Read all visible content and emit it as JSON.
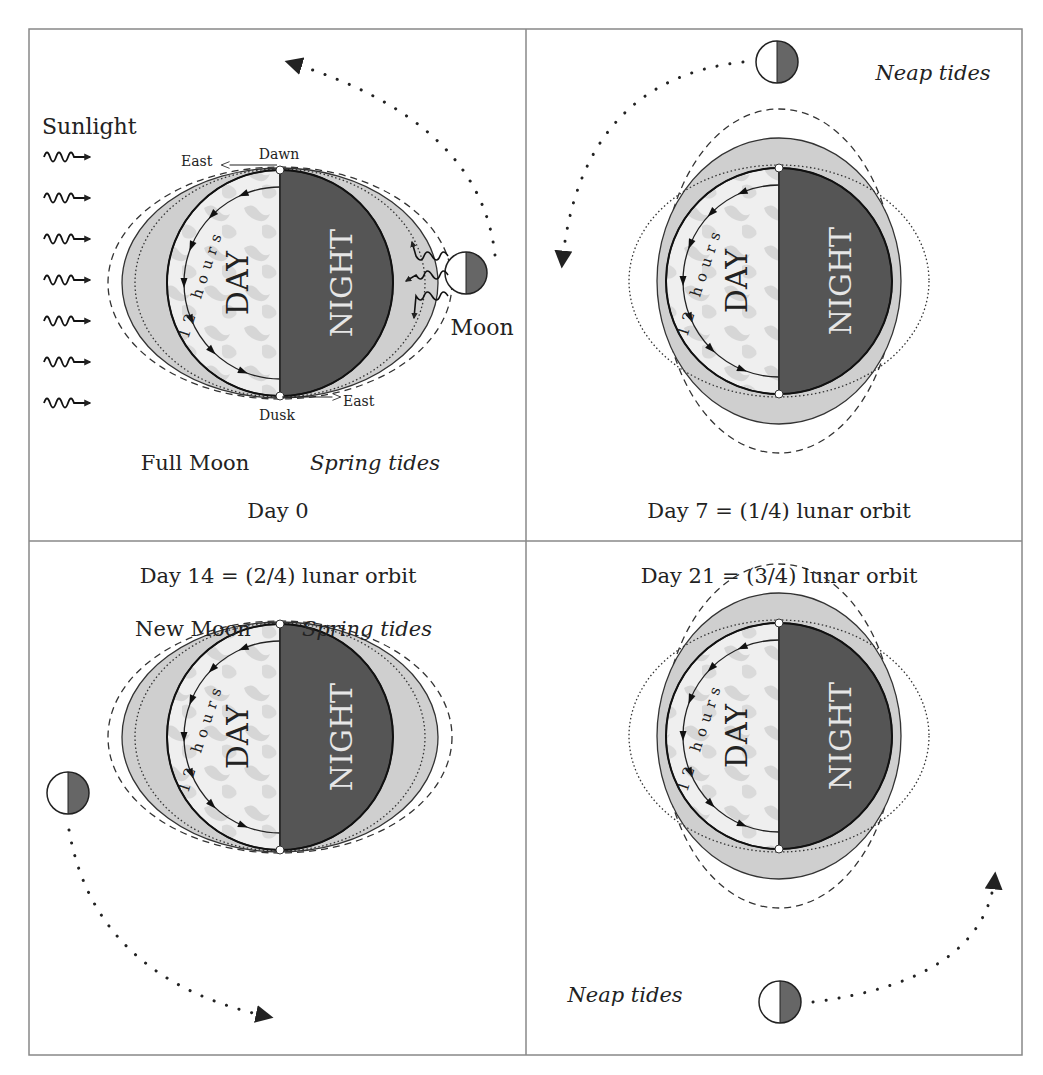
{
  "figure": {
    "colors": {
      "ocean_bulge": "#cfcfcf",
      "earth_day": "#e6e6e6",
      "earth_night": "#555555",
      "moon_dark": "#666666",
      "frame": "#888888",
      "ink": "#222222"
    },
    "common": {
      "day_label": "DAY",
      "night_label": "NIGHT",
      "hours_label": "12 hours"
    },
    "panels": [
      {
        "id": "day0",
        "caption": "Day 0",
        "phase_label": "Full Moon",
        "tide_label": "Spring tides",
        "sunlight_label": "Sunlight",
        "moon_label": "Moon",
        "dawn_label": "Dawn",
        "dusk_label": "Dusk",
        "east_label": "East",
        "bulge_orientation": "horizontal",
        "moon_position": "right",
        "orbit_arrow_direction": "counterclockwise"
      },
      {
        "id": "day7",
        "caption": "Day 7 = (1/4) lunar orbit",
        "tide_label": "Neap tides",
        "bulge_orientation": "vertical",
        "moon_position": "top",
        "orbit_arrow_direction": "counterclockwise"
      },
      {
        "id": "day14",
        "caption": "Day 14 = (2/4) lunar orbit",
        "phase_label": "New Moon",
        "tide_label": "Spring tides",
        "bulge_orientation": "horizontal",
        "moon_position": "left",
        "orbit_arrow_direction": "counterclockwise"
      },
      {
        "id": "day21",
        "caption": "Day 21 = (3/4) lunar orbit",
        "tide_label": "Neap tides",
        "bulge_orientation": "vertical",
        "moon_position": "bottom",
        "orbit_arrow_direction": "counterclockwise"
      }
    ]
  }
}
